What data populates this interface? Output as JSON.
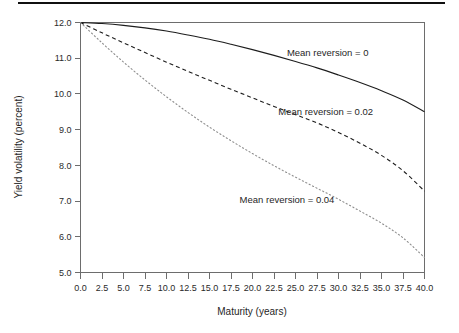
{
  "figure": {
    "background_color": "#ffffff",
    "rule_color": "#101010",
    "axis_color": "#6d6d6d"
  },
  "chart_data": {
    "type": "line",
    "title": "",
    "xlabel": "Maturity (years)",
    "ylabel": "Yield volatility (percent)",
    "xlim": [
      0.0,
      40.0
    ],
    "ylim": [
      5.0,
      12.0
    ],
    "grid": false,
    "legend_position": "inline-annotations",
    "xticks": [
      "0.0",
      "2.5",
      "5.0",
      "7.5",
      "10.0",
      "12.5",
      "15.0",
      "17.5",
      "20.0",
      "22.5",
      "25.0",
      "27.5",
      "30.0",
      "32.5",
      "35.0",
      "37.5",
      "40.0"
    ],
    "xtick_values": [
      0.0,
      2.5,
      5.0,
      7.5,
      10.0,
      12.5,
      15.0,
      17.5,
      20.0,
      22.5,
      25.0,
      27.5,
      30.0,
      32.5,
      35.0,
      37.5,
      40.0
    ],
    "yticks": [
      "5.0",
      "6.0",
      "7.0",
      "8.0",
      "9.0",
      "10.0",
      "11.0",
      "12.0"
    ],
    "ytick_values": [
      5.0,
      6.0,
      7.0,
      8.0,
      9.0,
      10.0,
      11.0,
      12.0
    ],
    "x": [
      0.0,
      2.5,
      5.0,
      7.5,
      10.0,
      12.5,
      15.0,
      17.5,
      20.0,
      22.5,
      25.0,
      27.5,
      30.0,
      32.5,
      35.0,
      37.5,
      40.0
    ],
    "series": [
      {
        "name": "Mean reversion = 0",
        "style": "solid",
        "color": "#1d1d1d",
        "label": "Mean reversion = 0",
        "values": [
          12.0,
          11.97,
          11.92,
          11.85,
          11.76,
          11.65,
          11.53,
          11.39,
          11.24,
          11.08,
          10.91,
          10.73,
          10.53,
          10.32,
          10.09,
          9.83,
          9.5
        ]
      },
      {
        "name": "Mean reversion = 0.02",
        "style": "dashed",
        "color": "#1d1d1d",
        "label": "Mean reversion = 0.02",
        "values": [
          12.0,
          11.71,
          11.43,
          11.16,
          10.89,
          10.63,
          10.38,
          10.13,
          9.89,
          9.65,
          9.42,
          9.19,
          8.92,
          8.62,
          8.28,
          7.85,
          7.28
        ]
      },
      {
        "name": "Mean reversion = 0.04",
        "style": "dotted",
        "color": "#8e8e8e",
        "label": "Mean reversion = 0.04",
        "values": [
          12.0,
          11.43,
          10.89,
          10.39,
          9.92,
          9.48,
          9.07,
          8.69,
          8.33,
          7.99,
          7.67,
          7.36,
          7.05,
          6.72,
          6.38,
          5.97,
          5.42
        ]
      }
    ],
    "annotations": [
      {
        "text": "Mean reversion = 0",
        "x": 24.0,
        "y": 11.05,
        "anchor": "start"
      },
      {
        "text": "Mean reversion = 0.02",
        "x": 23.0,
        "y": 9.4,
        "anchor": "start"
      },
      {
        "text": "Mean reversion = 0.04",
        "x": 18.5,
        "y": 6.95,
        "anchor": "start"
      }
    ]
  }
}
